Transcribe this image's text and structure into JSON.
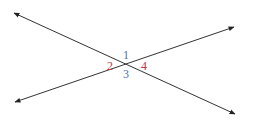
{
  "diagram": {
    "line_color": "#333333",
    "lines": [
      {
        "name": "line-a",
        "x1": 14,
        "y1": 13,
        "x2": 235,
        "y2": 114
      },
      {
        "name": "line-b",
        "x1": 15,
        "y1": 102,
        "x2": 234,
        "y2": 27
      }
    ],
    "intersection": {
      "x": 125,
      "y": 65
    },
    "angles": [
      {
        "label": "1",
        "color": "#4a6fb5",
        "x": 126,
        "y": 59
      },
      {
        "label": "2",
        "color": "#c0393b",
        "x": 110,
        "y": 70
      },
      {
        "label": "3",
        "color": "#4a6fb5",
        "x": 126,
        "y": 78
      },
      {
        "label": "4",
        "color": "#c0393b",
        "x": 144,
        "y": 70
      }
    ]
  }
}
